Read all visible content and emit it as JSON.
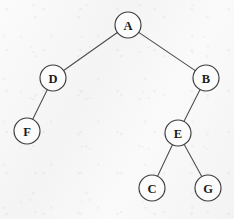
{
  "figure": {
    "type": "binary-tree-diagram",
    "width": 234,
    "height": 219,
    "background_color": "#f7f7f7",
    "stroke_color": "#3c3c3c",
    "node_fill_color": "#fcfcfc",
    "label_color": "#1c1c1c"
  },
  "nodes": [
    {
      "id": "A",
      "label": "A",
      "cx": 128,
      "cy": 25,
      "r": 13,
      "level": 0
    },
    {
      "id": "D",
      "label": "D",
      "cx": 53,
      "cy": 78,
      "r": 13,
      "level": 1
    },
    {
      "id": "B",
      "label": "B",
      "cx": 206,
      "cy": 78,
      "r": 13,
      "level": 1
    },
    {
      "id": "F",
      "label": "F",
      "cx": 27,
      "cy": 131,
      "r": 13,
      "level": 2
    },
    {
      "id": "E",
      "label": "E",
      "cx": 178,
      "cy": 133,
      "r": 13,
      "level": 2
    },
    {
      "id": "C",
      "label": "C",
      "cx": 152,
      "cy": 188,
      "r": 13,
      "level": 3
    },
    {
      "id": "G",
      "label": "G",
      "cx": 208,
      "cy": 188,
      "r": 13,
      "level": 3
    }
  ],
  "edges": [
    {
      "from": "A",
      "to": "D",
      "side": "left"
    },
    {
      "from": "A",
      "to": "B",
      "side": "right"
    },
    {
      "from": "D",
      "to": "F",
      "side": "left"
    },
    {
      "from": "B",
      "to": "E",
      "side": "left"
    },
    {
      "from": "E",
      "to": "C",
      "side": "left"
    },
    {
      "from": "E",
      "to": "G",
      "side": "right"
    }
  ]
}
